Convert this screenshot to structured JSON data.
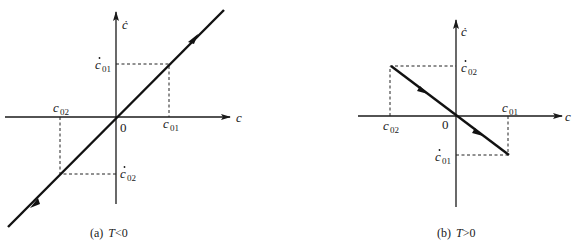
{
  "panels": [
    {
      "id": "a",
      "caption_prefix": "(a)",
      "caption_var": "T",
      "caption_rel": "<0",
      "x_axis_label": "c",
      "y_axis_label": "ċ",
      "origin_label": "0",
      "labels": {
        "c01": {
          "base": "c",
          "sub": "01",
          "dot": false
        },
        "c02": {
          "base": "c",
          "sub": "02",
          "dot": false
        },
        "cdot01": {
          "base": "c",
          "sub": "01",
          "dot": true
        },
        "cdot02": {
          "base": "c",
          "sub": "02",
          "dot": true
        }
      },
      "trajectory": "line through origin with positive slope, arrows pointing away from origin (outward)"
    },
    {
      "id": "b",
      "caption_prefix": "(b)",
      "caption_var": "T",
      "caption_rel": ">0",
      "x_axis_label": "c",
      "y_axis_label": "ċ",
      "origin_label": "0",
      "labels": {
        "c01": {
          "base": "c",
          "sub": "01",
          "dot": false
        },
        "c02": {
          "base": "c",
          "sub": "02",
          "dot": false
        },
        "cdot01": {
          "base": "c",
          "sub": "01",
          "dot": true
        },
        "cdot02": {
          "base": "c",
          "sub": "02",
          "dot": true
        }
      },
      "trajectory": "segment with negative slope from (c02, ċ02) to (c01, ċ01), arrows pointing downward-right"
    }
  ]
}
